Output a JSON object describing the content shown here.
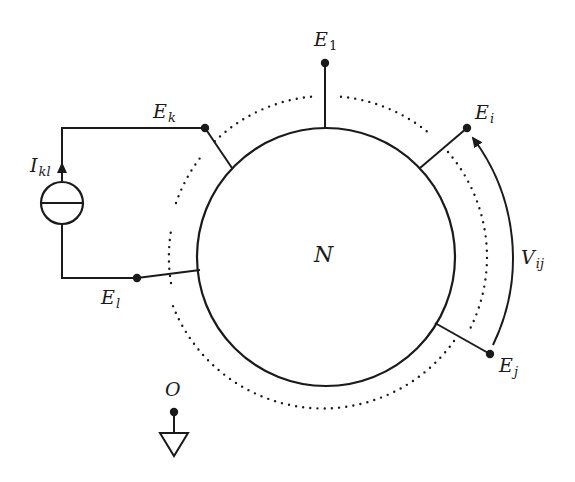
{
  "diagram": {
    "network": {
      "label": "N",
      "center": [
        326,
        257
      ],
      "radius": 129
    },
    "boundary": {
      "style": "dotted",
      "radius": 161
    },
    "terminals": [
      {
        "id": "E1",
        "base": "E",
        "sub": "1",
        "dot": [
          325,
          63
        ],
        "attach": [
          325,
          128
        ]
      },
      {
        "id": "Ek",
        "base": "E",
        "sub": "k",
        "dot": [
          205,
          128
        ],
        "attach": [
          232,
          168
        ]
      },
      {
        "id": "Ei",
        "base": "E",
        "sub": "i",
        "dot": [
          467,
          128
        ],
        "attach": [
          420,
          168
        ]
      },
      {
        "id": "El",
        "base": "E",
        "sub": "l",
        "dot": [
          137,
          278
        ],
        "attach": [
          200,
          270
        ]
      },
      {
        "id": "Ej",
        "base": "E",
        "sub": "j",
        "dot": [
          490,
          354
        ],
        "attach": [
          435,
          323
        ]
      }
    ],
    "current_source": {
      "base": "I",
      "sub": "kl",
      "between": [
        "Ek",
        "El"
      ],
      "direction": "up"
    },
    "voltage": {
      "base": "V",
      "sub": "ij",
      "from": "Ej",
      "to": "Ei"
    },
    "ground": {
      "label": "O"
    },
    "colors": {
      "stroke": "#1a1a1a",
      "background": "#ffffff"
    }
  }
}
